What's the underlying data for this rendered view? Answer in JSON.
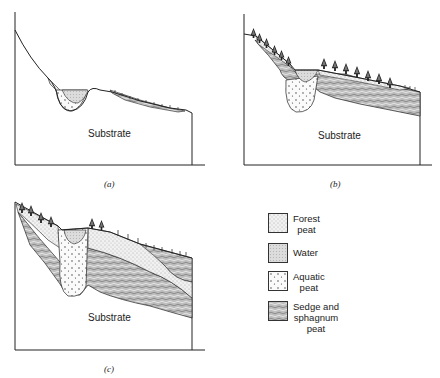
{
  "panels": [
    {
      "id": "a",
      "caption": "(a)",
      "substrate_label": "Substrate"
    },
    {
      "id": "b",
      "caption": "(b)",
      "substrate_label": "Substrate"
    },
    {
      "id": "c",
      "caption": "(c)",
      "substrate_label": "Substrate"
    }
  ],
  "legend": {
    "items": [
      {
        "label_line1": "Forest",
        "label_line2": "peat",
        "pattern": "forest-peat"
      },
      {
        "label_line1": "Water",
        "label_line2": "",
        "pattern": "water"
      },
      {
        "label_line1": "Aquatic",
        "label_line2": "peat",
        "pattern": "aquatic-peat"
      },
      {
        "label_line1": "Sedge and",
        "label_line2": "sphagnum",
        "label_line3": "peat",
        "pattern": "sedge-peat"
      }
    ]
  },
  "colors": {
    "line": "#222222",
    "background": "#ffffff"
  }
}
